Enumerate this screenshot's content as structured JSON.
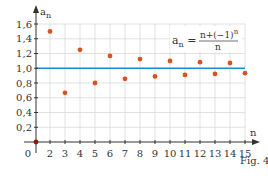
{
  "chart_data": {
    "type": "scatter",
    "title": "",
    "formula": {
      "lhs": "a",
      "lhs_sub": "n",
      "numerator": "n+(−1)",
      "numerator_sup": "n",
      "denominator": "n"
    },
    "xlabel": "n",
    "ylabel": "a",
    "ylabel_sub": "n",
    "caption": "Fig. 4",
    "x_ticks": [
      "0",
      "2",
      "3",
      "4",
      "5",
      "6",
      "7",
      "8",
      "9",
      "10",
      "11",
      "12",
      "13",
      "14",
      "15"
    ],
    "y_ticks": [
      "0,2",
      "0,4",
      "0,6",
      "0,8",
      "1,0",
      "1,2",
      "1,4",
      "1,6"
    ],
    "ylim": [
      0,
      1.6
    ],
    "xlim": [
      0,
      15
    ],
    "grid": true,
    "reference_line": {
      "y": 1.0,
      "color": "#1a8fd0"
    },
    "points": [
      {
        "x": 0,
        "y": 0
      },
      {
        "x": 2,
        "y": 1.5
      },
      {
        "x": 3,
        "y": 0.667
      },
      {
        "x": 4,
        "y": 1.25
      },
      {
        "x": 5,
        "y": 0.8
      },
      {
        "x": 6,
        "y": 1.167
      },
      {
        "x": 7,
        "y": 0.857
      },
      {
        "x": 8,
        "y": 1.125
      },
      {
        "x": 9,
        "y": 0.889
      },
      {
        "x": 10,
        "y": 1.1
      },
      {
        "x": 11,
        "y": 0.909
      },
      {
        "x": 12,
        "y": 1.083
      },
      {
        "x": 13,
        "y": 0.923
      },
      {
        "x": 14,
        "y": 1.071
      },
      {
        "x": 15,
        "y": 0.933
      }
    ],
    "colors": {
      "points": "#d9531e",
      "origin_point": "#8b1a10",
      "grid": "#d4d4d4",
      "axes": "#333333"
    }
  }
}
